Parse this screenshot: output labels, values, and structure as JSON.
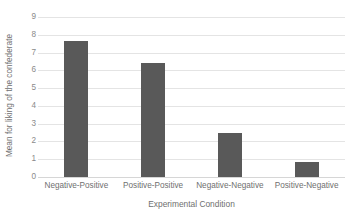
{
  "chart_data": {
    "type": "bar",
    "title": "",
    "subtitle": "",
    "xlabel": "Experimental Condition",
    "ylabel": "Mean for liking of the confederate",
    "categories": [
      "Negative-Positive",
      "Positive-Positive",
      "Negative-Negative",
      "Positive-Negative"
    ],
    "values": [
      7.65,
      6.4,
      2.5,
      0.85
    ],
    "ylim": [
      0,
      9
    ],
    "ytick_labels": [
      "0",
      "1",
      "2",
      "3",
      "4",
      "5",
      "6",
      "7",
      "8",
      "9"
    ],
    "ytick_values": [
      0,
      1,
      2,
      3,
      4,
      5,
      6,
      7,
      8,
      9
    ],
    "grid": true,
    "grid_orientation": "horizontal",
    "legend": false,
    "legend_position": "none",
    "bar_color": "#595959",
    "gridline_color": "#e4e4e4",
    "axis_color": "#d6d6d6",
    "background_color": "#ffffff",
    "text_color": "#6f6f6f"
  }
}
